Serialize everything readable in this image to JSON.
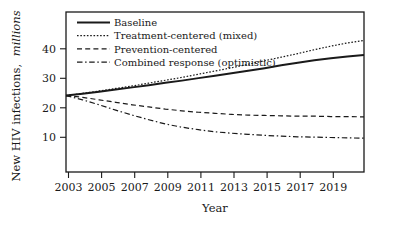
{
  "chart_data": {
    "type": "line",
    "title": "",
    "xlabel": "Year",
    "ylabel": "New HIV infections, millions",
    "ylabel_plain": "New HIV infections,",
    "ylabel_italic": "millions",
    "xlim": [
      2002,
      2020
    ],
    "ylim": [
      0,
      45
    ],
    "grid": false,
    "legend_position": "top-left",
    "xticks": [
      2003,
      2005,
      2007,
      2009,
      2011,
      2013,
      2015,
      2017,
      2019
    ],
    "xtick_labels": [
      "2003",
      "2005",
      "2007",
      "2009",
      "2011",
      "2013",
      "2015",
      "2017",
      "2019"
    ],
    "yticks": [
      10,
      20,
      30,
      40
    ],
    "ytick_labels": [
      "10",
      "20",
      "30",
      "40"
    ],
    "x": [
      2002,
      2003,
      2004,
      2005,
      2006,
      2007,
      2008,
      2009,
      2010,
      2011,
      2012,
      2013,
      2014,
      2015,
      2016,
      2017,
      2018,
      2019,
      2020
    ],
    "series": [
      {
        "name": "Baseline",
        "style": "solid",
        "color": "#1a1a1a",
        "width": 2.0,
        "values": [
          21.5,
          22.0,
          22.6,
          23.2,
          23.8,
          24.4,
          25.1,
          25.7,
          26.4,
          27.1,
          27.8,
          28.5,
          29.2,
          30.0,
          30.7,
          31.4,
          32.0,
          32.5,
          32.9
        ]
      },
      {
        "name": "Treatment-centered (mixed)",
        "style": "dotted",
        "color": "#1a1a1a",
        "width": 1.2,
        "values": [
          21.5,
          22.1,
          22.8,
          23.5,
          24.2,
          25.0,
          25.8,
          26.6,
          27.5,
          28.4,
          29.3,
          30.3,
          31.3,
          32.3,
          33.3,
          34.4,
          35.4,
          36.3,
          37.0
        ]
      },
      {
        "name": "Prevention-centered",
        "style": "dashed",
        "color": "#1a1a1a",
        "width": 1.2,
        "values": [
          21.5,
          21.0,
          20.3,
          19.6,
          18.9,
          18.3,
          17.7,
          17.2,
          16.8,
          16.5,
          16.2,
          16.0,
          15.9,
          15.8,
          15.7,
          15.7,
          15.6,
          15.6,
          15.5
        ]
      },
      {
        "name": "Combined response (optimistic)",
        "style": "dashdot",
        "color": "#1a1a1a",
        "width": 1.2,
        "values": [
          21.5,
          20.3,
          18.9,
          17.4,
          16.0,
          14.7,
          13.5,
          12.6,
          11.9,
          11.3,
          10.9,
          10.6,
          10.3,
          10.1,
          9.9,
          9.8,
          9.7,
          9.6,
          9.5
        ]
      }
    ]
  },
  "legend": {
    "entries": [
      {
        "label": "Baseline",
        "style": "solid"
      },
      {
        "label": "Treatment-centered (mixed)",
        "style": "dotted"
      },
      {
        "label": "Prevention-centered",
        "style": "dashed"
      },
      {
        "label": "Combined response (optimistic)",
        "style": "dashdot"
      }
    ]
  }
}
